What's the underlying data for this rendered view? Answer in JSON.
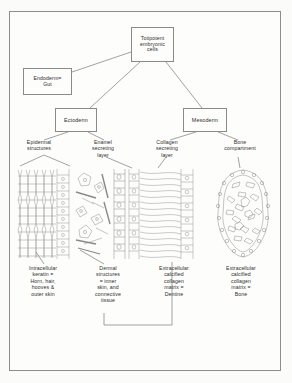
{
  "figure": {
    "title_hidden": "Embryonic germ layer derivation of dental and skeletal hard tissues",
    "line_color": "#7a7a7a",
    "text_color": "#2e2e2e",
    "frame_color": "#8d8d8d",
    "background": "#fdfdfc"
  },
  "nodes": {
    "totipotent": "Totipotent\nembryonic\ncells",
    "endoderm": "Endoderm=\nGut",
    "ectoderm": "Ectoderm",
    "mesoderm": "Mesoderm"
  },
  "branches": {
    "epidermal_structures": "Epidermal\nstructures",
    "enamel_secreting_layer": "Enamel\nsecreting\nlayer",
    "collagen_secreting_layer": "Collagen\nsecreting\nlayer",
    "bone_compartment": "Bone\ncompartment"
  },
  "captions": {
    "keratin": "Intracellular\nkeratin =\nHorn, hair,\nhooves &\nouter skin",
    "dermal": "Dermal\nstructures\n= inner\nskin, and\nconnective\ntissue",
    "dentine": "Extracellular\ncalcified\ncollagen\nmatrix =\nDentine",
    "bone": "Extracellular\ncalcified\ncollagen\nmatrix =\nBone"
  },
  "micrographs": {
    "epidermis": "epidermis-keratin-histology",
    "dermis": "dermis-connective-tissue-histology",
    "dentine": "dentine-tubules-odontoblast-histology",
    "bone": "bone-trabecula-lacunae-histology"
  }
}
